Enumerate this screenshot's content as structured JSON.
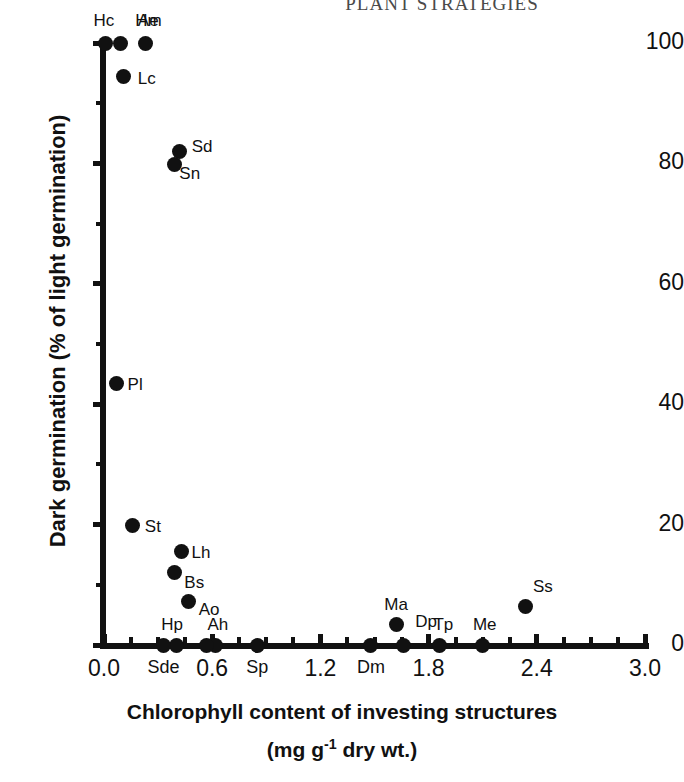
{
  "running_head": "PLANT STRATEGIES",
  "chart_data": {
    "type": "scatter",
    "title": "",
    "xlabel_line1": "Chlorophyll content of investing structures",
    "xlabel_line2_pre": "(mg g",
    "xlabel_line2_sup": "-1",
    "xlabel_line2_post": " dry wt.)",
    "ylabel": "Dark germination (% of light germination)",
    "xlim": [
      0.0,
      3.0
    ],
    "ylim": [
      0,
      100
    ],
    "grid": false,
    "legend": "none",
    "marker": "filled-circle",
    "marker_color": "#111111",
    "xticks": [
      0.0,
      0.6,
      1.2,
      1.8,
      2.4,
      3.0
    ],
    "xtick_labels": [
      "0.0",
      "0.6",
      "1.2",
      "1.8",
      "2.4",
      "3.0"
    ],
    "xticks_minor": [
      0.15,
      0.3,
      0.45,
      0.75,
      0.9,
      1.05,
      1.35,
      1.5,
      1.65,
      1.95,
      2.1,
      2.25,
      2.55,
      2.7,
      2.85
    ],
    "yticks": [
      0,
      20,
      40,
      60,
      80,
      100
    ],
    "ytick_labels": [
      "0",
      "20",
      "40",
      "60",
      "80",
      "100"
    ],
    "yticks_minor": [
      10,
      30,
      50,
      70,
      90
    ],
    "points": [
      {
        "label": "Hc",
        "x": 0.01,
        "y": 100,
        "lx": -2,
        "ly": -32,
        "anchor": "center"
      },
      {
        "label": "Ae",
        "x": 0.09,
        "y": 100,
        "lx": 28,
        "ly": -32,
        "anchor": "center"
      },
      {
        "label": "Hm",
        "x": 0.23,
        "y": 100,
        "lx": 3,
        "ly": -32,
        "anchor": "center"
      },
      {
        "label": "Lc",
        "x": 0.11,
        "y": 94.5,
        "lx": 14,
        "ly": 2,
        "anchor": "left"
      },
      {
        "label": "Sd",
        "x": 0.42,
        "y": 82,
        "lx": 12,
        "ly": -5,
        "anchor": "left"
      },
      {
        "label": "Sn",
        "x": 0.39,
        "y": 79.8,
        "lx": 5,
        "ly": 8,
        "anchor": "left"
      },
      {
        "label": "Pl",
        "x": 0.07,
        "y": 43.5,
        "lx": 11,
        "ly": 1,
        "anchor": "left"
      },
      {
        "label": "St",
        "x": 0.16,
        "y": 19.8,
        "lx": 12,
        "ly": 0,
        "anchor": "left"
      },
      {
        "label": "Lh",
        "x": 0.43,
        "y": 15.5,
        "lx": 10,
        "ly": 0,
        "anchor": "left"
      },
      {
        "label": "Bs",
        "x": 0.39,
        "y": 12.0,
        "lx": 10,
        "ly": 9,
        "anchor": "left"
      },
      {
        "label": "Ao",
        "x": 0.47,
        "y": 7.3,
        "lx": 10,
        "ly": 8,
        "anchor": "left"
      },
      {
        "label": "Ma",
        "x": 1.62,
        "y": 3.4,
        "lx": 0,
        "ly": -30,
        "anchor": "center"
      },
      {
        "label": "Ss",
        "x": 2.34,
        "y": 6.4,
        "lx": 7,
        "ly": -20,
        "anchor": "left"
      },
      {
        "label": "Hp",
        "x": 0.4,
        "y": 0,
        "lx": -4,
        "ly": -30,
        "anchor": "center"
      },
      {
        "label": "Ah",
        "x": 0.62,
        "y": 0,
        "lx": 2,
        "ly": -30,
        "anchor": "center"
      },
      {
        "label": "Dp",
        "x": 1.66,
        "y": 0,
        "lx": 12,
        "ly": -24,
        "anchor": "left"
      },
      {
        "label": "Tp",
        "x": 1.86,
        "y": 0,
        "lx": 4,
        "ly": -30,
        "anchor": "center"
      },
      {
        "label": "Me",
        "x": 2.1,
        "y": 0,
        "lx": 2,
        "ly": -30,
        "anchor": "center"
      },
      {
        "label": "Sde",
        "x": 0.33,
        "y": 0,
        "axis_label": true
      },
      {
        "label": "Sp",
        "x": 0.85,
        "y": 0,
        "axis_label": true
      },
      {
        "label": "Dm",
        "x": 1.48,
        "y": 0,
        "axis_label": true
      },
      {
        "label": "",
        "x": 0.57,
        "y": 0,
        "axis_label": false,
        "unlabeled": true
      }
    ]
  }
}
